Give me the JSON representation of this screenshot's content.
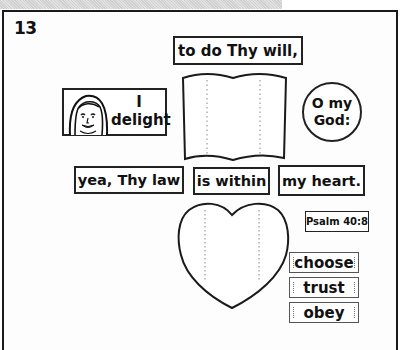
{
  "page": {
    "lesson_number": "13"
  },
  "verse_cards": {
    "to_do": "to do Thy will,",
    "i_line": "I",
    "delight_line": "delight",
    "o_my": "O my",
    "god": "God:",
    "yea_thy_law": "yea, Thy law",
    "is_within": "is within",
    "my_heart": "my heart."
  },
  "reference": {
    "label": "Psalm 40:8"
  },
  "choices": [
    {
      "label": "choose"
    },
    {
      "label": "trust"
    },
    {
      "label": "obey"
    }
  ],
  "shapes": {
    "book": "open-book-cutout",
    "heart": "heart-cutout",
    "portrait": "woman-face-icon"
  },
  "colors": {
    "ink": "#111111",
    "border": "#222222",
    "paper": "#ffffff",
    "band": "#d9d9d9"
  }
}
